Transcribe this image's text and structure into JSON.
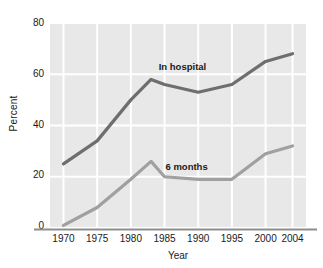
{
  "chart_data": {
    "type": "line",
    "title": "",
    "xlabel": "Year",
    "ylabel": "Percent",
    "xlim": [
      1968,
      2006
    ],
    "ylim": [
      0,
      80
    ],
    "grid": true,
    "legend_position": "inline-annotation",
    "xticks": [
      "1970",
      "1975",
      "1980",
      "1985",
      "1990",
      "1995",
      "2000",
      "2004"
    ],
    "xtick_values": [
      1970,
      1975,
      1980,
      1985,
      1990,
      1995,
      2000,
      2004
    ],
    "yticks": [
      "0",
      "20",
      "40",
      "60",
      "80"
    ],
    "ytick_values": [
      0,
      20,
      40,
      60,
      80
    ],
    "x": [
      1970,
      1975,
      1980,
      1983,
      1985,
      1990,
      1995,
      2000,
      2004
    ],
    "series": [
      {
        "name": "In hospital",
        "color": "#6e6e6e",
        "values": [
          25,
          34,
          50,
          58,
          56,
          53,
          56,
          65,
          68
        ],
        "label_x": 1988,
        "label_y": 63
      },
      {
        "name": "6 months",
        "color": "#a0a0a0",
        "values": [
          1,
          8,
          19,
          26,
          20,
          19,
          19,
          29,
          32
        ],
        "label_x": 1989,
        "label_y": 24
      }
    ]
  },
  "axes": {
    "background_color": "#e8e8e8",
    "gridline_color": "#ffffff",
    "axis_line_color": "#8d8d8d"
  }
}
